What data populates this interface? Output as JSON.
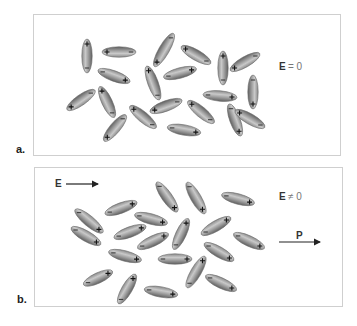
{
  "figure": {
    "panels": [
      {
        "id": "a",
        "label": "a.",
        "field_label_E": "E",
        "field_label_rel": "= 0",
        "description": "Randomly oriented dipoles, no applied field",
        "box": {
          "x": 33,
          "y": 14,
          "w": 308,
          "h": 142
        },
        "molecules": [
          {
            "cx": 87,
            "cy": 56,
            "angle": -90,
            "len": 34
          },
          {
            "cx": 119,
            "cy": 52,
            "angle": 180,
            "len": 34
          },
          {
            "cx": 114,
            "cy": 76,
            "angle": 20,
            "len": 34
          },
          {
            "cx": 164,
            "cy": 50,
            "angle": 120,
            "len": 38
          },
          {
            "cx": 196,
            "cy": 55,
            "angle": -150,
            "len": 34
          },
          {
            "cx": 153,
            "cy": 83,
            "angle": -110,
            "len": 36
          },
          {
            "cx": 180,
            "cy": 73,
            "angle": -15,
            "len": 34
          },
          {
            "cx": 223,
            "cy": 68,
            "angle": -90,
            "len": 34
          },
          {
            "cx": 245,
            "cy": 62,
            "angle": 150,
            "len": 34
          },
          {
            "cx": 253,
            "cy": 92,
            "angle": 90,
            "len": 34
          },
          {
            "cx": 81,
            "cy": 100,
            "angle": 145,
            "len": 34
          },
          {
            "cx": 107,
            "cy": 102,
            "angle": -115,
            "len": 34
          },
          {
            "cx": 143,
            "cy": 117,
            "angle": -140,
            "len": 34
          },
          {
            "cx": 166,
            "cy": 106,
            "angle": 160,
            "len": 34
          },
          {
            "cx": 201,
            "cy": 112,
            "angle": -140,
            "len": 34
          },
          {
            "cx": 220,
            "cy": 96,
            "angle": 5,
            "len": 34
          },
          {
            "cx": 235,
            "cy": 120,
            "angle": 70,
            "len": 34
          },
          {
            "cx": 115,
            "cy": 128,
            "angle": 130,
            "len": 34
          },
          {
            "cx": 184,
            "cy": 130,
            "angle": 10,
            "len": 34
          },
          {
            "cx": 250,
            "cy": 119,
            "angle": -150,
            "len": 34
          }
        ]
      },
      {
        "id": "b",
        "label": "b.",
        "field_label_E": "E",
        "field_label_rel": "≠ 0",
        "applied_field_label": "E",
        "polarization_label": "P",
        "description": "Dipoles partially aligned with applied field E, producing net polarization P",
        "box": {
          "x": 34,
          "y": 167,
          "w": 309,
          "h": 140
        },
        "molecules": [
          {
            "cx": 89,
            "cy": 221,
            "angle": 40,
            "len": 36
          },
          {
            "cx": 121,
            "cy": 208,
            "angle": -20,
            "len": 34
          },
          {
            "cx": 167,
            "cy": 197,
            "angle": 55,
            "len": 36
          },
          {
            "cx": 196,
            "cy": 198,
            "angle": 60,
            "len": 36
          },
          {
            "cx": 238,
            "cy": 199,
            "angle": 15,
            "len": 34
          },
          {
            "cx": 151,
            "cy": 219,
            "angle": 15,
            "len": 34
          },
          {
            "cx": 86,
            "cy": 236,
            "angle": 30,
            "len": 34
          },
          {
            "cx": 130,
            "cy": 232,
            "angle": -20,
            "len": 34
          },
          {
            "cx": 153,
            "cy": 241,
            "angle": -25,
            "len": 34
          },
          {
            "cx": 181,
            "cy": 234,
            "angle": -65,
            "len": 34
          },
          {
            "cx": 216,
            "cy": 226,
            "angle": -30,
            "len": 34
          },
          {
            "cx": 249,
            "cy": 241,
            "angle": 25,
            "len": 34
          },
          {
            "cx": 125,
            "cy": 256,
            "angle": 15,
            "len": 34
          },
          {
            "cx": 175,
            "cy": 259,
            "angle": 0,
            "len": 34
          },
          {
            "cx": 219,
            "cy": 252,
            "angle": 30,
            "len": 34
          },
          {
            "cx": 98,
            "cy": 278,
            "angle": -25,
            "len": 32
          },
          {
            "cx": 127,
            "cy": 289,
            "angle": -60,
            "len": 34
          },
          {
            "cx": 161,
            "cy": 292,
            "angle": 10,
            "len": 34
          },
          {
            "cx": 196,
            "cy": 272,
            "angle": -60,
            "len": 36
          },
          {
            "cx": 221,
            "cy": 283,
            "angle": 25,
            "len": 34
          }
        ]
      }
    ]
  },
  "colors": {
    "border": "#cfcfcf",
    "molecule_dark": "#6b6b6b",
    "molecule_light": "#c8c8c8",
    "text": "#222222",
    "arrow": "#222222"
  }
}
